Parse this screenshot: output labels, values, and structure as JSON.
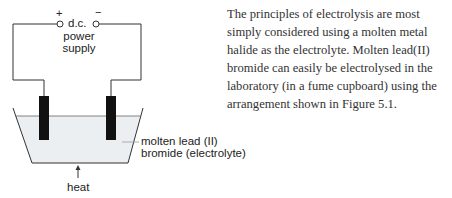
{
  "figure": {
    "power_supply": {
      "positive_sign": "+",
      "negative_sign": "−",
      "label_line1": "d.c.",
      "label_line2": "power",
      "label_line3": "supply"
    },
    "electrolyte_label": {
      "line1": "molten lead (II)",
      "line2": "bromide (electrolyte)"
    },
    "heat_label": "heat",
    "colors": {
      "electrode": "#111111",
      "liquid": "#eceff1",
      "line": "#333333"
    }
  },
  "paragraph": {
    "text": "The principles of electrolysis are most simply considered using a molten metal halide as the electrolyte. Molten lead(II) bromide can easily be electrolysed in the laboratory (in a fume cupboard) using the arrangement shown in Figure 5.1."
  }
}
